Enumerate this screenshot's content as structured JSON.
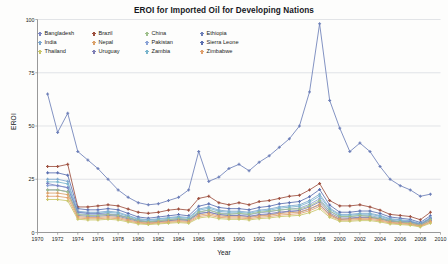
{
  "chart_data": {
    "type": "line",
    "title": "EROI for Imported Oil for Developing Nations",
    "xlabel": "Year",
    "ylabel": "EROI",
    "xlim": [
      1970,
      2010
    ],
    "ylim": [
      0,
      100
    ],
    "xticks": [
      1970,
      1972,
      1974,
      1976,
      1978,
      1980,
      1982,
      1984,
      1986,
      1988,
      1990,
      1992,
      1994,
      1996,
      1998,
      2000,
      2002,
      2004,
      2006,
      2008,
      2010
    ],
    "yticks": [
      0,
      25,
      50,
      75,
      100
    ],
    "grid": "horizontal",
    "legend_position": "upper-left-inside",
    "legend_columns": 4,
    "x": [
      1971,
      1972,
      1973,
      1974,
      1975,
      1976,
      1977,
      1978,
      1979,
      1980,
      1981,
      1982,
      1983,
      1984,
      1985,
      1986,
      1987,
      1988,
      1989,
      1990,
      1991,
      1992,
      1993,
      1994,
      1995,
      1996,
      1997,
      1998,
      1999,
      2000,
      2001,
      2002,
      2003,
      2004,
      2005,
      2006,
      2007,
      2008,
      2009
    ],
    "series": [
      {
        "name": "Bangladesh",
        "color": "#7b86c4",
        "values": [
          23,
          22,
          21,
          9.5,
          9,
          9,
          8.5,
          8,
          7,
          5.5,
          5,
          5,
          5.5,
          6,
          6,
          9,
          9.5,
          8.5,
          8,
          8,
          7.5,
          8,
          8.5,
          9,
          10,
          9.5,
          11,
          13,
          8.5,
          6,
          6.5,
          7,
          7,
          6.5,
          5.5,
          5,
          5,
          3.8,
          6.5
        ]
      },
      {
        "name": "Brazil",
        "color": "#9d4f3e",
        "values": [
          31,
          31,
          32,
          12,
          12,
          12.5,
          13,
          12.5,
          11,
          9.5,
          9,
          9.5,
          10.5,
          11,
          10.5,
          16,
          17,
          14,
          13,
          14,
          13,
          14.5,
          15,
          16,
          17,
          17.5,
          20,
          23,
          15,
          12.5,
          12.5,
          13,
          12,
          10.5,
          8.5,
          8,
          7.5,
          6,
          9.5
        ]
      },
      {
        "name": "China",
        "color": "#9fc08c",
        "values": [
          20,
          20,
          19,
          8.5,
          8,
          8,
          8.5,
          8,
          7,
          5.5,
          5,
          5.5,
          6,
          6.5,
          6,
          9.5,
          10.5,
          9,
          8.5,
          9,
          8.5,
          9.5,
          10,
          10.5,
          11,
          11,
          12.5,
          15,
          10,
          7.5,
          7.5,
          8,
          7.5,
          6.5,
          5.5,
          5,
          4.5,
          3.5,
          6
        ]
      },
      {
        "name": "Ethiopia",
        "color": "#6d7fb8",
        "values": [
          65,
          47,
          56,
          38,
          34,
          30,
          25,
          20,
          16.5,
          14,
          13,
          13.5,
          15,
          16.5,
          20,
          38,
          24,
          26,
          30,
          32,
          29,
          33,
          36,
          40,
          44,
          50,
          66,
          98,
          62,
          49,
          38,
          42,
          38,
          31,
          25,
          22,
          20,
          17,
          18
        ]
      },
      {
        "name": "India",
        "color": "#7ea8cf"
      },
      {
        "name": "Nepal",
        "color": "#dba26a"
      },
      {
        "name": "Pakistan",
        "color": "#8ba3d6"
      },
      {
        "name": "Sierra Leone",
        "color": "#5b6fb0"
      },
      {
        "name": "Thailand",
        "color": "#c9c66a"
      },
      {
        "name": "Uruguay",
        "color": "#7f7fb5"
      },
      {
        "name": "Zambia",
        "color": "#79b5cd"
      },
      {
        "name": "Zimbabwe",
        "color": "#e0a06d"
      }
    ],
    "all_series_values": {
      "India": [
        25,
        25,
        24,
        10,
        9.5,
        9.5,
        10,
        9.5,
        8,
        6.5,
        6,
        6.5,
        7,
        7.5,
        7,
        11,
        12,
        10.5,
        10,
        10,
        9.5,
        10.5,
        11,
        12,
        12.5,
        13,
        15,
        18,
        11.5,
        8.5,
        8.5,
        9,
        9,
        8,
        6.5,
        6,
        5.5,
        4.2,
        7
      ]
    },
    "legend_order": [
      [
        "Bangladesh",
        "Brazil",
        "China",
        "Ethiopia"
      ],
      [
        "India",
        "Nepal",
        "Pakistan",
        "Sierra Leone"
      ],
      [
        "Thailand",
        "Uruguay",
        "Zambia",
        "Zimbabwe"
      ]
    ]
  },
  "legend": [
    {
      "label": "Bangladesh",
      "color": "#7b86c4"
    },
    {
      "label": "Brazil",
      "color": "#9d4f3e"
    },
    {
      "label": "China",
      "color": "#9fc08c"
    },
    {
      "label": "Ethiopia",
      "color": "#6d7fb8"
    },
    {
      "label": "India",
      "color": "#7ea8cf"
    },
    {
      "label": "Nepal",
      "color": "#dba26a"
    },
    {
      "label": "Pakistan",
      "color": "#8ba3d6"
    },
    {
      "label": "Sierra Leone",
      "color": "#5b6fb0"
    },
    {
      "label": "Thailand",
      "color": "#c9c66a"
    },
    {
      "label": "Uruguay",
      "color": "#7f7fb5"
    },
    {
      "label": "Zambia",
      "color": "#79b5cd"
    },
    {
      "label": "Zimbabwe",
      "color": "#e0a06d"
    }
  ]
}
